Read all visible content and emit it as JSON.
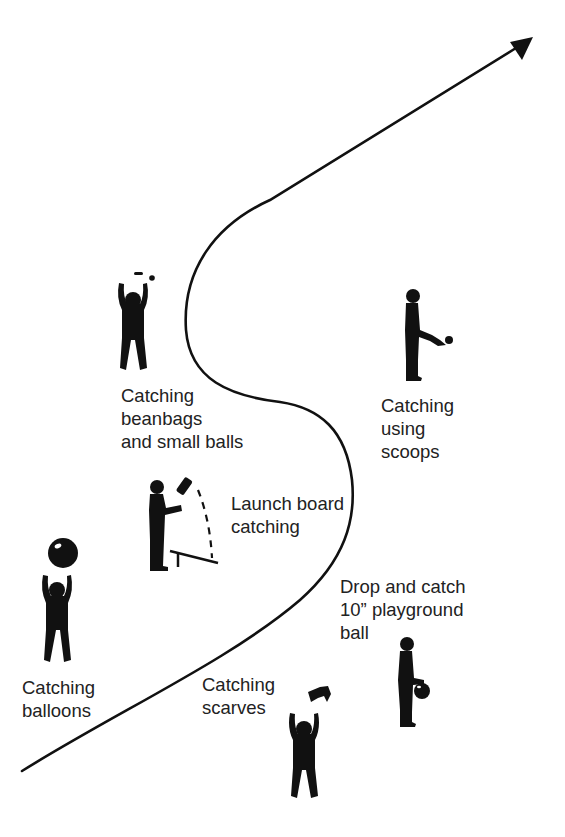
{
  "diagram": {
    "type": "progression-path",
    "colors": {
      "ink": "#111111",
      "text": "#222222",
      "background": "#ffffff"
    },
    "path": {
      "start": "bottom-left",
      "end": "top-right",
      "end_marker": "arrowhead"
    },
    "stations": [
      {
        "id": "balloons",
        "lines": [
          "Catching",
          "balloons"
        ],
        "icon": "child-catching-balloon-icon"
      },
      {
        "id": "scarves",
        "lines": [
          "Catching",
          "scarves"
        ],
        "icon": "child-catching-scarf-icon"
      },
      {
        "id": "drop-catch",
        "lines": [
          "Drop and catch",
          "10” playground",
          "ball"
        ],
        "icon": "child-bouncing-ball-icon"
      },
      {
        "id": "launch-board",
        "lines": [
          "Launch board",
          "catching"
        ],
        "icon": "child-launch-board-icon"
      },
      {
        "id": "beanbags",
        "lines": [
          "Catching",
          "beanbags",
          "and small balls"
        ],
        "icon": "child-catching-beanbag-icon"
      },
      {
        "id": "scoops",
        "lines": [
          "Catching",
          "using",
          "scoops"
        ],
        "icon": "child-scoop-catch-icon"
      }
    ]
  }
}
